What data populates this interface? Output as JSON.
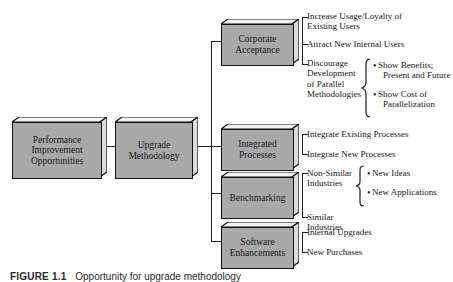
{
  "figure": {
    "caption_label": "FIGURE 1.1",
    "caption_text": "Opportunity for upgrade methodology"
  },
  "diagram": {
    "type": "tree",
    "root": {
      "id": "performance-improvement-opportunities",
      "label": "Performance\nImprovement\nOpportunities",
      "line1": "Performance",
      "line2": "Improvement",
      "line3": "Opportunities"
    },
    "level2": {
      "id": "upgrade-methodology",
      "line1": "Upgrade",
      "line2": "Methodology"
    },
    "branches": [
      {
        "id": "corporate-acceptance",
        "line1": "Corporate",
        "line2": "Acceptance",
        "leaves": [
          {
            "id": "increase-usage-loyalty",
            "line1": "Increase Usage/Loyalty of",
            "line2": "Existing Users",
            "sub": []
          },
          {
            "id": "attract-new-internal-users",
            "line1": "Attract New Internal Users",
            "line2": "",
            "sub": []
          },
          {
            "id": "discourage-parallel-development",
            "line1": "Discourage",
            "line2": "Development",
            "line3": "of Parallel",
            "line4": "Methodologies",
            "sub": [
              {
                "id": "show-benefits",
                "line1": "Show Benefits;",
                "line2": "Present and Future"
              },
              {
                "id": "show-cost-parallelization",
                "line1": "Show Cost of",
                "line2": "Parallelization"
              }
            ]
          }
        ]
      },
      {
        "id": "integrated-processes",
        "line1": "Integrated",
        "line2": "Processes",
        "leaves": [
          {
            "id": "integrate-existing-processes",
            "line1": "Integrate Existing Processes",
            "sub": []
          },
          {
            "id": "integrate-new-processes",
            "line1": "Integrate New Processes",
            "sub": []
          }
        ]
      },
      {
        "id": "benchmarking",
        "line1": "Benchmarking",
        "line2": "",
        "leaves": [
          {
            "id": "non-similar-industries",
            "line1": "Non-Similar",
            "line2": "Industries",
            "sub": [
              {
                "id": "new-ideas",
                "line1": "New Ideas",
                "line2": ""
              },
              {
                "id": "new-applications",
                "line1": "New Applications",
                "line2": ""
              }
            ]
          },
          {
            "id": "similar-industries",
            "line1": "Similar",
            "line2": "Industries",
            "sub": []
          }
        ]
      },
      {
        "id": "software-enhancements",
        "line1": "Software",
        "line2": "Enhancements",
        "leaves": [
          {
            "id": "internal-upgrades",
            "line1": "Internal Upgrades",
            "sub": []
          },
          {
            "id": "new-purchases",
            "line1": "New Purchases",
            "sub": []
          }
        ]
      }
    ]
  },
  "colors": {
    "box_fill": "#a9a9a9",
    "box_outline": "#111111",
    "line": "#1d1d1d",
    "text": "#16161a",
    "background": "#ffffff"
  }
}
